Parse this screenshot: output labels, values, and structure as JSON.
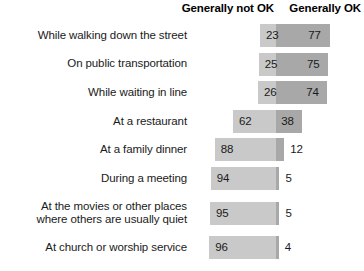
{
  "header": {
    "not_ok_label": "Generally not OK",
    "ok_label": "Generally OK"
  },
  "colors": {
    "not_ok_fill": "#c9c9c9",
    "ok_fill": "#a8a8a8",
    "text": "#1a1a1a",
    "background": "#ffffff"
  },
  "chart_data": {
    "type": "bar",
    "subtype": "diverging-stacked-bar",
    "title": "",
    "subtitle": "",
    "xlabel": "",
    "ylabel": "",
    "xlim": [
      0,
      100
    ],
    "grid": false,
    "legend_position": "top",
    "value_suffix": "%",
    "categories": [
      "While walking down the street",
      "On public transportation",
      "While waiting in line",
      "At a restaurant",
      "At a family dinner",
      "During a meeting",
      "At the movies or other places where others are usually quiet",
      "At church or worship service"
    ],
    "category_lines": [
      [
        "While walking down the street"
      ],
      [
        "On public transportation"
      ],
      [
        "While waiting in line"
      ],
      [
        "At a restaurant"
      ],
      [
        "At a family dinner"
      ],
      [
        "During a meeting"
      ],
      [
        "At the movies or other places",
        "where others are usually quiet"
      ],
      [
        "At church or worship service"
      ]
    ],
    "series": [
      {
        "name": "Generally not OK",
        "color": "#c9c9c9",
        "values": [
          23,
          25,
          26,
          62,
          88,
          94,
          95,
          96
        ]
      },
      {
        "name": "Generally OK",
        "color": "#a8a8a8",
        "values": [
          77,
          75,
          74,
          38,
          12,
          5,
          5,
          4
        ]
      }
    ]
  }
}
